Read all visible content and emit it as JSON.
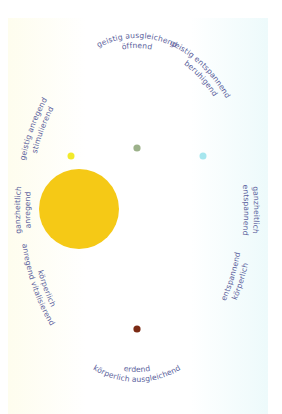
{
  "colors": {
    "text": "#5b5f9c",
    "panel_left": "#fefdf0",
    "panel_mid": "#ffffff",
    "panel_right": "#eefbfc"
  },
  "labels": {
    "top": {
      "outer": "geistig ausgleichend",
      "inner": "öffnend"
    },
    "top_right": {
      "outer": "geistig entspannend",
      "inner": "beruhigend"
    },
    "right": {
      "outer": "ganzheitlich",
      "inner": "entspannend"
    },
    "bottom_right": {
      "outer": "körperlich",
      "inner": "entspannend"
    },
    "bottom": {
      "outer": "körperlich ausgleichend",
      "inner": "erdend"
    },
    "bottom_left": {
      "outer": "anregend vitalisierend",
      "inner": "körperlich"
    },
    "left": {
      "outer": "ganzheitlich",
      "inner": "anregend"
    },
    "top_left": {
      "outer": "geistig anregend",
      "inner": "stimulierend"
    }
  },
  "dots": [
    {
      "name": "large-yellow-dot",
      "position": "left",
      "color": "#f5c916",
      "size": "large"
    },
    {
      "name": "yellow-dot",
      "position": "top-left",
      "color": "#f2ea2a",
      "size": "small"
    },
    {
      "name": "green-dot",
      "position": "top",
      "color": "#9cb18a",
      "size": "small"
    },
    {
      "name": "cyan-dot",
      "position": "top-right",
      "color": "#a6e6ee",
      "size": "small"
    },
    {
      "name": "brown-dot",
      "position": "bottom",
      "color": "#7b2a14",
      "size": "small"
    }
  ]
}
